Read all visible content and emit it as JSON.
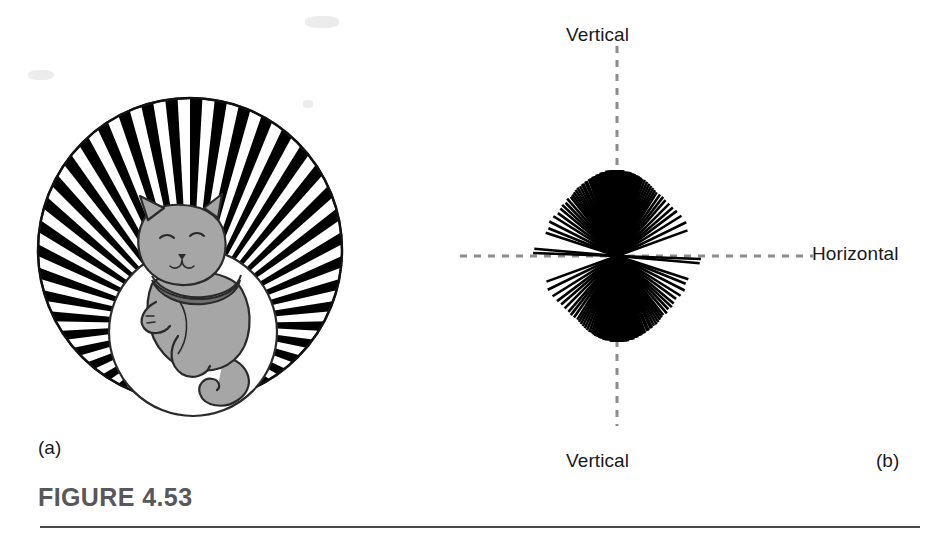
{
  "figure": {
    "title": "FIGURE 4.53",
    "rule_color": "#4a4a4d",
    "title_color": "#58585b"
  },
  "panels": [
    {
      "id": "a",
      "caption": "(a)",
      "description": "kitten-in-vertical-stripe-drum",
      "circle": {
        "center_x": 190,
        "center_y": 250,
        "radius": 152
      },
      "stripes": {
        "count": 44,
        "dark_color": "#000000",
        "light_color": "#ffffff"
      },
      "cat": {
        "body_color": "#a6a6a6",
        "outline_color": "#1a1a1a",
        "collar_color": "#6e6e6e"
      }
    },
    {
      "id": "b",
      "caption": "(b)",
      "description": "orientation-preference-fan-plot",
      "center_x": 607,
      "center_y": 256,
      "axis_color": "#8c8c8c",
      "line_color": "#000000",
      "labels": {
        "vertical_top": "Vertical",
        "vertical_bottom": "Vertical",
        "horizontal": "Horizontal"
      }
    }
  ],
  "chart_data": {
    "type": "line",
    "xlabel": "",
    "ylabel": "",
    "angle_units": "degrees clockwise from vertical",
    "axis_ranges": {
      "vertical_axis_deg": 0,
      "horizontal_axis_deg": 90
    },
    "grid": false,
    "legend": "none",
    "series": [
      {
        "name": "preferred orientation (deg from vertical)",
        "values": [
          -88,
          -85,
          -72,
          -68,
          -63,
          -58,
          -54,
          -50,
          -47,
          -44,
          -41,
          -38,
          -36,
          -34,
          -32,
          -30,
          -28,
          -26,
          -25,
          -23,
          -22,
          -20,
          -19,
          -18,
          -17,
          -16,
          -15,
          -14,
          -13,
          -12,
          -11,
          -10,
          -9,
          -8,
          -7,
          -6,
          -5,
          -4,
          -3,
          -2,
          -1,
          0,
          1,
          2,
          3,
          4,
          5,
          6,
          7,
          8,
          9,
          10,
          11,
          12,
          13,
          14,
          15,
          16,
          17,
          18,
          20,
          22,
          24,
          26,
          28,
          30,
          32,
          35,
          38,
          41,
          45,
          49,
          53,
          58,
          64,
          70
        ],
        "line_lengths": [
          168,
          166,
          150,
          148,
          152,
          150,
          146,
          148,
          150,
          148,
          152,
          150,
          152,
          154,
          156,
          158,
          158,
          160,
          160,
          162,
          162,
          164,
          164,
          164,
          166,
          166,
          166,
          168,
          168,
          168,
          170,
          170,
          170,
          170,
          172,
          172,
          172,
          172,
          172,
          172,
          172,
          172,
          172,
          172,
          172,
          172,
          170,
          170,
          170,
          170,
          170,
          168,
          168,
          168,
          166,
          166,
          166,
          164,
          164,
          162,
          162,
          160,
          158,
          156,
          154,
          152,
          150,
          150,
          150,
          148,
          148,
          148,
          150,
          152,
          154,
          150
        ]
      }
    ]
  }
}
